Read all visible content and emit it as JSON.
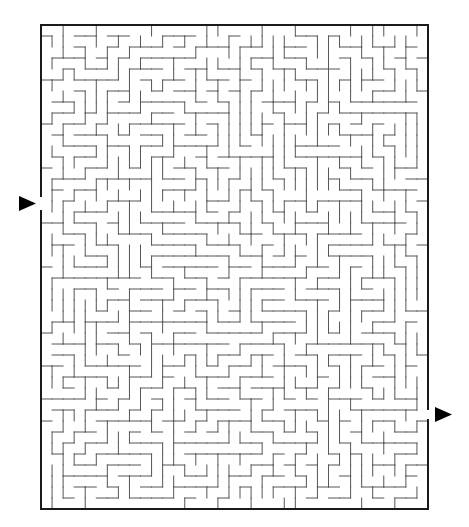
{
  "maze": {
    "frame": {
      "left": 41,
      "top": 25,
      "right": 428,
      "bottom": 509
    },
    "cols": 35,
    "rows": 44,
    "cell_size": 11,
    "seed": 20240611,
    "wall_color": "#555555",
    "frame_color": "#1a1a1a",
    "entrance": {
      "side": "left",
      "row": 16,
      "y_from": 196,
      "y_to": 211
    },
    "exit": {
      "side": "right",
      "row": 35,
      "y_from": 409,
      "y_to": 420
    }
  },
  "arrows": {
    "entrance": {
      "points": "19,196 36,203.5 19,211",
      "color": "#000000",
      "direction": "right"
    },
    "exit": {
      "points": "435,407 452,414.5 435,422",
      "color": "#000000",
      "direction": "right"
    }
  }
}
